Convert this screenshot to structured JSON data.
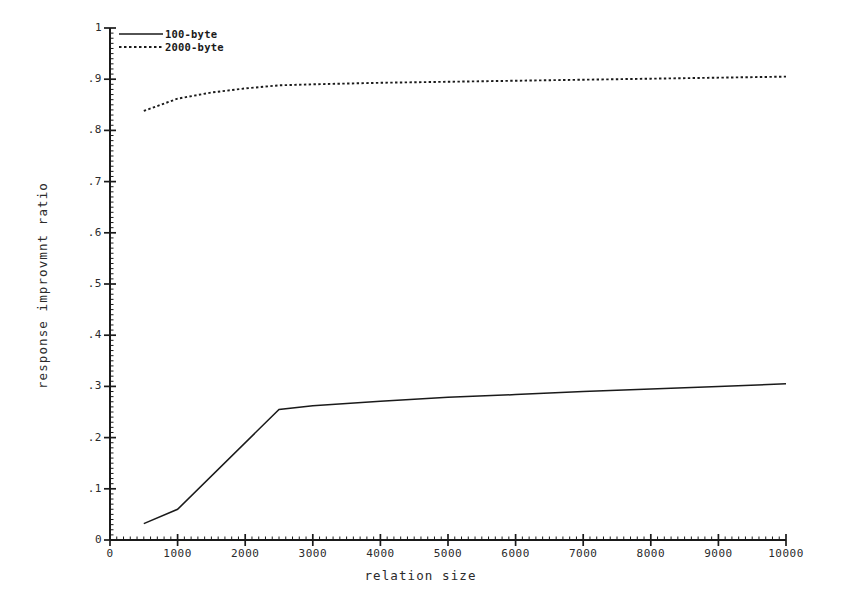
{
  "chart_data": {
    "type": "line",
    "title": "",
    "xlabel": "relation size",
    "ylabel": "response improvmnt ratio",
    "xlim": [
      0,
      10000
    ],
    "ylim": [
      0,
      1
    ],
    "grid": false,
    "legend_position": "top-left",
    "xticks": [
      0,
      1000,
      2000,
      3000,
      4000,
      5000,
      6000,
      7000,
      8000,
      9000,
      10000
    ],
    "xticklabels": [
      "0",
      "1000",
      "2000",
      "3000",
      "4000",
      "5000",
      "6000",
      "7000",
      "8000",
      "9000",
      "10000"
    ],
    "yticks": [
      0,
      0.1,
      0.2,
      0.3,
      0.4,
      0.5,
      0.6,
      0.7,
      0.8,
      0.9,
      1
    ],
    "yticklabels": [
      "0",
      ".1",
      ".2",
      ".3",
      ".4",
      ".5",
      ".6",
      ".7",
      ".8",
      ".9",
      "1"
    ],
    "series": [
      {
        "name": "100-byte",
        "style": "solid",
        "color": "#1a1a1a",
        "x": [
          500,
          1000,
          2500,
          3000,
          4000,
          5000,
          6000,
          7000,
          8000,
          9000,
          10000
        ],
        "values": [
          0.032,
          0.06,
          0.255,
          0.262,
          0.271,
          0.279,
          0.284,
          0.29,
          0.295,
          0.3,
          0.305
        ]
      },
      {
        "name": "2000-byte",
        "style": "dotted",
        "color": "#1a1a1a",
        "x": [
          500,
          1000,
          1500,
          2000,
          2500,
          3000,
          4000,
          5000,
          6000,
          7000,
          8000,
          9000,
          10000
        ],
        "values": [
          0.838,
          0.862,
          0.874,
          0.882,
          0.888,
          0.89,
          0.893,
          0.895,
          0.897,
          0.899,
          0.901,
          0.903,
          0.905
        ]
      }
    ]
  },
  "legend": {
    "entries": [
      {
        "label": "100-byte",
        "style": "solid"
      },
      {
        "label": "2000-byte",
        "style": "dotted"
      }
    ]
  },
  "axes": {
    "x_title": "relation size",
    "y_title": "response improvmnt ratio"
  }
}
